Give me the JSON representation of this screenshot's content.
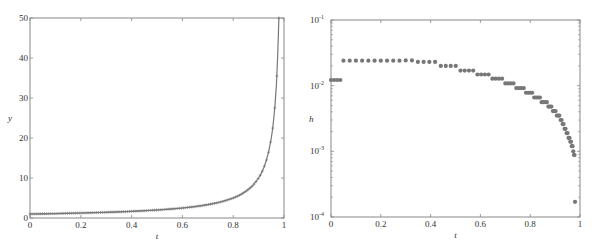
{
  "figure": {
    "width": 599,
    "height": 247,
    "background": "#ffffff",
    "axes_color": "#888888",
    "marker_color": "#777777"
  },
  "chart_data": [
    {
      "id": "left",
      "type": "line",
      "title": "",
      "xlabel": "t",
      "ylabel": "y",
      "xlim": [
        0,
        1
      ],
      "ylim": [
        0,
        50
      ],
      "grid": false,
      "xticks": [
        0,
        0.2,
        0.4,
        0.6,
        0.8,
        1
      ],
      "xtick_labels": [
        "0",
        "0.2",
        "0.4",
        "0.6",
        "0.8",
        "1"
      ],
      "yticks": [
        0,
        10,
        20,
        30,
        40,
        50
      ],
      "ytick_labels": [
        "0",
        "10",
        "20",
        "30",
        "40",
        "50"
      ],
      "series": [
        {
          "name": "y(t) = 1/(1-t)",
          "marker": "+",
          "line": true,
          "x": [
            0,
            0.05,
            0.1,
            0.15,
            0.2,
            0.25,
            0.3,
            0.35,
            0.4,
            0.45,
            0.5,
            0.55,
            0.6,
            0.65,
            0.7,
            0.75,
            0.8,
            0.825,
            0.85,
            0.875,
            0.9,
            0.91,
            0.92,
            0.93,
            0.94,
            0.95,
            0.955,
            0.96,
            0.965,
            0.97,
            0.975,
            0.98
          ],
          "y": [
            1.0,
            1.05,
            1.11,
            1.18,
            1.25,
            1.33,
            1.43,
            1.54,
            1.67,
            1.82,
            2.0,
            2.22,
            2.5,
            2.86,
            3.33,
            4.0,
            5.0,
            5.71,
            6.67,
            8.0,
            10.0,
            11.1,
            12.5,
            14.3,
            16.7,
            20.0,
            22.2,
            25.0,
            28.6,
            33.3,
            40.0,
            50.0
          ]
        }
      ],
      "frame_px": {
        "left": 30,
        "top": 18,
        "right": 284,
        "bottom": 218
      }
    },
    {
      "id": "right",
      "type": "scatter",
      "title": "",
      "xlabel": "t",
      "ylabel": "h",
      "xlim": [
        0,
        1
      ],
      "ylim": [
        0.0001,
        0.1
      ],
      "yscale": "log",
      "grid": false,
      "xticks": [
        0,
        0.2,
        0.4,
        0.6,
        0.8,
        1
      ],
      "xtick_labels": [
        "0",
        "0.2",
        "0.4",
        "0.6",
        "0.8",
        "1"
      ],
      "yticks": [
        0.0001,
        0.001,
        0.01,
        0.1
      ],
      "ytick_labels": [
        {
          "base": "10",
          "exp": "-4"
        },
        {
          "base": "10",
          "exp": "-3"
        },
        {
          "base": "10",
          "exp": "-2"
        },
        {
          "base": "10",
          "exp": "-1"
        }
      ],
      "series": [
        {
          "name": "step size h",
          "marker": "o",
          "x": [
            0,
            0.0125,
            0.025,
            0.0375,
            0.05,
            0.075,
            0.1,
            0.125,
            0.15,
            0.175,
            0.2,
            0.225,
            0.25,
            0.275,
            0.3,
            0.325,
            0.349,
            0.372,
            0.395,
            0.418,
            0.441,
            0.461,
            0.481,
            0.501,
            0.52,
            0.537,
            0.554,
            0.571,
            0.588,
            0.603,
            0.618,
            0.633,
            0.648,
            0.661,
            0.674,
            0.687,
            0.7,
            0.711,
            0.722,
            0.733,
            0.744,
            0.754,
            0.764,
            0.774,
            0.783,
            0.792,
            0.8,
            0.808,
            0.816,
            0.824,
            0.832,
            0.839,
            0.846,
            0.853,
            0.86,
            0.867,
            0.873,
            0.879,
            0.885,
            0.891,
            0.897,
            0.902,
            0.907,
            0.912,
            0.917,
            0.922,
            0.926,
            0.93,
            0.934,
            0.938,
            0.942,
            0.946,
            0.95,
            0.954,
            0.958,
            0.961,
            0.964,
            0.967,
            0.97,
            0.973,
            0.976,
            0.978,
            0.98
          ],
          "y": [
            0.0122,
            0.0122,
            0.0122,
            0.0122,
            0.024,
            0.024,
            0.024,
            0.024,
            0.024,
            0.024,
            0.024,
            0.024,
            0.024,
            0.024,
            0.0242,
            0.0242,
            0.023,
            0.023,
            0.023,
            0.023,
            0.02,
            0.02,
            0.02,
            0.02,
            0.017,
            0.017,
            0.017,
            0.017,
            0.0148,
            0.0148,
            0.0148,
            0.0148,
            0.0128,
            0.0128,
            0.0128,
            0.0128,
            0.0108,
            0.0108,
            0.0108,
            0.0108,
            0.0092,
            0.0092,
            0.0092,
            0.0092,
            0.0078,
            0.0078,
            0.0078,
            0.0078,
            0.0066,
            0.0066,
            0.0066,
            0.0066,
            0.0056,
            0.0056,
            0.0056,
            0.0056,
            0.0048,
            0.0048,
            0.0048,
            0.0041,
            0.0041,
            0.0041,
            0.0035,
            0.0035,
            0.0035,
            0.003,
            0.003,
            0.0026,
            0.0026,
            0.0022,
            0.0022,
            0.0019,
            0.0019,
            0.0016,
            0.0016,
            0.0014,
            0.0014,
            0.0012,
            0.0012,
            0.001,
            0.00088,
            0.00088,
            0.00017
          ]
        }
      ],
      "frame_px": {
        "left": 331,
        "top": 20,
        "right": 580,
        "bottom": 217
      }
    }
  ]
}
